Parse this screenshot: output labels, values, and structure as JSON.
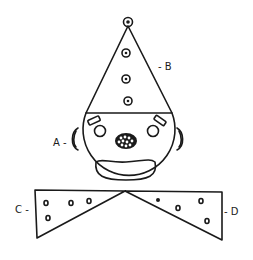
{
  "figure": {
    "labels": {
      "A": "A -",
      "B": "- B",
      "C": "C -",
      "D": "- D"
    },
    "parts": {
      "A": "ear",
      "B": "hat",
      "C": "bow tie left wing",
      "D": "bow tie right wing"
    },
    "colors": {
      "ink": "#1a1a1a",
      "background": "#ffffff"
    }
  }
}
